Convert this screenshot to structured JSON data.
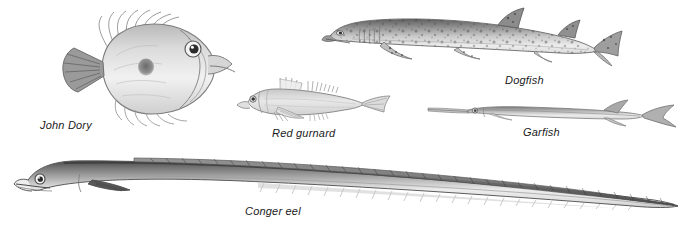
{
  "plate": {
    "background_color": "#ffffff",
    "ink_color": "#4a4a4a",
    "label_color": "#1a1a1a",
    "width": 692,
    "height": 236,
    "style": "pencil-illustration"
  },
  "figures": [
    {
      "id": "john-dory",
      "label": "John Dory",
      "common_name": "John Dory",
      "facing": "right",
      "body_shape": "deep oval laterally compressed",
      "distinctive_marks": "dark round spot on flank, long trailing dorsal spines, large eye"
    },
    {
      "id": "red-gurnard",
      "label": "Red gurnard",
      "common_name": "Red gurnard",
      "facing": "left",
      "body_shape": "tapering with large blunt head",
      "distinctive_marks": "spiny dorsal fins, pectoral finger rays"
    },
    {
      "id": "dogfish",
      "label": "Dogfish",
      "common_name": "Dogfish",
      "facing": "left",
      "body_shape": "elongated shark-like",
      "distinctive_marks": "dense dark spots over back, two dorsal fins set far back, asymmetric tail"
    },
    {
      "id": "garfish",
      "label": "Garfish",
      "common_name": "Garfish",
      "facing": "left",
      "body_shape": "very elongated needle-like",
      "distinctive_marks": "long slender beak, forked tail, dorsal and anal fins set far back"
    },
    {
      "id": "conger-eel",
      "label": "Conger eel",
      "common_name": "Conger eel",
      "facing": "left",
      "body_shape": "very long snake-like tapering to a point",
      "distinctive_marks": "continuous dorsal fin along body, large round eye, open mouth"
    }
  ]
}
